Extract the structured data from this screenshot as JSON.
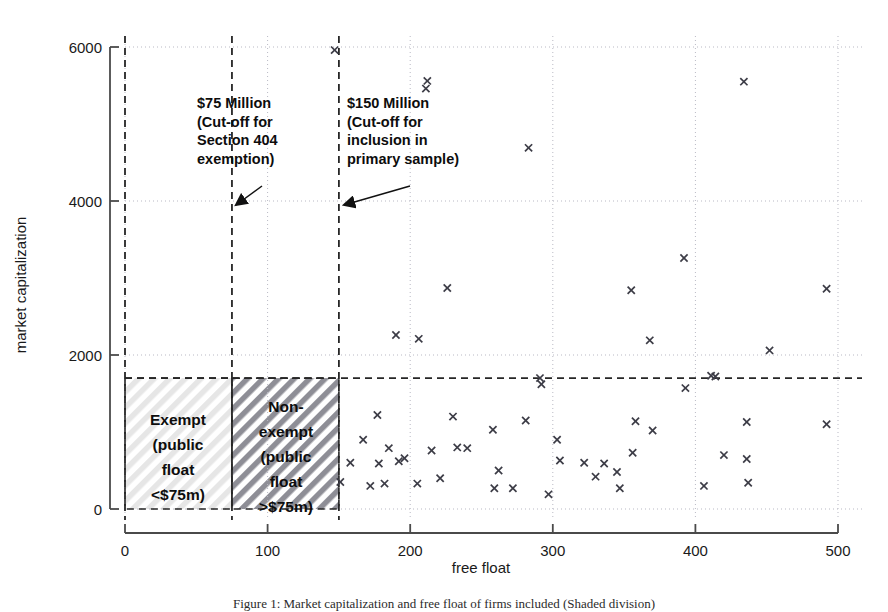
{
  "chart_data": {
    "type": "scatter",
    "title": "",
    "xlabel": "free float",
    "ylabel": "market capitalization",
    "xlim": [
      -25,
      520
    ],
    "ylim": [
      -220,
      6300
    ],
    "xticks": [
      0,
      100,
      200,
      300,
      400,
      500
    ],
    "yticks": [
      0,
      2000,
      4000,
      6000
    ],
    "xtick_labels": [
      "0",
      "100",
      "200",
      "300",
      "400",
      "500"
    ],
    "ytick_labels": [
      "0",
      "2000",
      "4000",
      "6000"
    ],
    "grid": "dotted gridlines at every tick, both axes",
    "legend": "none",
    "marker": "x",
    "marker_color": "#3c3c46",
    "points": [
      {
        "x": 147,
        "y": 5960
      },
      {
        "x": 212,
        "y": 5560
      },
      {
        "x": 211,
        "y": 5460
      },
      {
        "x": 434,
        "y": 5550
      },
      {
        "x": 283,
        "y": 4690
      },
      {
        "x": 392,
        "y": 3260
      },
      {
        "x": 226,
        "y": 2870
      },
      {
        "x": 355,
        "y": 2840
      },
      {
        "x": 492,
        "y": 2860
      },
      {
        "x": 452,
        "y": 2060
      },
      {
        "x": 368,
        "y": 2190
      },
      {
        "x": 206,
        "y": 2210
      },
      {
        "x": 190,
        "y": 2260
      },
      {
        "x": 291,
        "y": 1700
      },
      {
        "x": 411,
        "y": 1730
      },
      {
        "x": 414,
        "y": 1720
      },
      {
        "x": 292,
        "y": 1620
      },
      {
        "x": 393,
        "y": 1570
      },
      {
        "x": 177,
        "y": 1220
      },
      {
        "x": 230,
        "y": 1200
      },
      {
        "x": 281,
        "y": 1150
      },
      {
        "x": 358,
        "y": 1140
      },
      {
        "x": 436,
        "y": 1130
      },
      {
        "x": 492,
        "y": 1100
      },
      {
        "x": 370,
        "y": 1020
      },
      {
        "x": 258,
        "y": 1030
      },
      {
        "x": 303,
        "y": 900
      },
      {
        "x": 167,
        "y": 900
      },
      {
        "x": 185,
        "y": 790
      },
      {
        "x": 233,
        "y": 800
      },
      {
        "x": 240,
        "y": 790
      },
      {
        "x": 215,
        "y": 760
      },
      {
        "x": 356,
        "y": 730
      },
      {
        "x": 420,
        "y": 700
      },
      {
        "x": 436,
        "y": 650
      },
      {
        "x": 305,
        "y": 630
      },
      {
        "x": 322,
        "y": 600
      },
      {
        "x": 336,
        "y": 590
      },
      {
        "x": 158,
        "y": 600
      },
      {
        "x": 178,
        "y": 590
      },
      {
        "x": 192,
        "y": 620
      },
      {
        "x": 196,
        "y": 660
      },
      {
        "x": 262,
        "y": 500
      },
      {
        "x": 345,
        "y": 480
      },
      {
        "x": 151,
        "y": 350
      },
      {
        "x": 172,
        "y": 300
      },
      {
        "x": 182,
        "y": 330
      },
      {
        "x": 205,
        "y": 330
      },
      {
        "x": 221,
        "y": 400
      },
      {
        "x": 259,
        "y": 270
      },
      {
        "x": 272,
        "y": 270
      },
      {
        "x": 330,
        "y": 420
      },
      {
        "x": 437,
        "y": 340
      },
      {
        "x": 406,
        "y": 300
      },
      {
        "x": 347,
        "y": 270
      },
      {
        "x": 297,
        "y": 190
      }
    ],
    "vertical_cutoff_lines": [
      {
        "x": 0,
        "style": "dashed"
      },
      {
        "x": 75,
        "style": "dashed"
      },
      {
        "x": 150,
        "style": "dashed"
      }
    ],
    "horizontal_cutoff_lines": [
      {
        "y": 1700,
        "style": "dashed"
      }
    ],
    "annotations": [
      {
        "name": "cutoff-75m",
        "lines": [
          "$75 Million",
          "(Cut-off for",
          "Section 404",
          "exemption)"
        ],
        "points_to": {
          "x": 75,
          "y": 4000
        }
      },
      {
        "name": "cutoff-150m",
        "lines": [
          "$150 Million",
          "(Cut-off for",
          "inclusion in",
          "primary sample)"
        ],
        "points_to": {
          "x": 150,
          "y": 4000
        }
      }
    ],
    "shaded_regions": [
      {
        "name": "exempt",
        "lines": [
          "Exempt",
          "(public",
          "float",
          "<$75m)"
        ],
        "x_range": [
          0,
          75
        ],
        "y_range": [
          0,
          1700
        ],
        "hatch": "light-diagonal"
      },
      {
        "name": "non-exempt",
        "lines": [
          "Non-",
          "exempt",
          "(public",
          "float",
          ">$75m)"
        ],
        "x_range": [
          75,
          150
        ],
        "y_range": [
          0,
          1700
        ],
        "hatch": "dark-diagonal"
      }
    ]
  },
  "caption": {
    "text": "Figure 1: Market capitalization and free float of firms included (Shaded division)"
  },
  "colors": {
    "marker": "#3c3c46",
    "axis": "#4a4a4a",
    "grid": "#b9b9c4",
    "cutoff_line": "#262626",
    "hatch_light": "#e2e2e2",
    "hatch_dark": "#8e8e96",
    "text": "#111111"
  }
}
